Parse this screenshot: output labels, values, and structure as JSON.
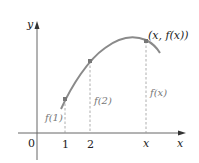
{
  "diagram": {
    "axes": {
      "x_label": "x",
      "y_label": "y",
      "origin_label": "0"
    },
    "ticks": [
      {
        "label": "1"
      },
      {
        "label": "2"
      },
      {
        "label": "x"
      }
    ],
    "point_labels": {
      "value_1": "f(1)",
      "value_2": "f(2)",
      "value_x": "f(x)",
      "point_x": "(x, f(x))"
    },
    "colors": {
      "curve": "#8a8a8a",
      "axis": "#555555",
      "dashed": "#999999",
      "text": "#222222",
      "value_text": "#777777"
    }
  }
}
